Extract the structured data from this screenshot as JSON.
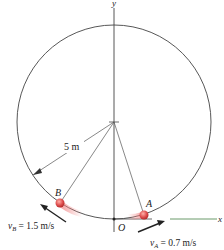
{
  "diagram": {
    "axes": {
      "y_label": "y",
      "x_label": "x",
      "origin_label": "O"
    },
    "radius_label": "5 m",
    "particle_A": {
      "label": "A",
      "velocity_symbol": "v",
      "velocity_sub": "A",
      "velocity_value": " = 0.7 m/s"
    },
    "particle_B": {
      "label": "B",
      "velocity_symbol": "v",
      "velocity_sub": "B",
      "velocity_value": " = 1.5 m/s"
    },
    "colors": {
      "particle": "#d94a4a",
      "line": "#444444",
      "x_axis": "#6a9a6a"
    }
  }
}
